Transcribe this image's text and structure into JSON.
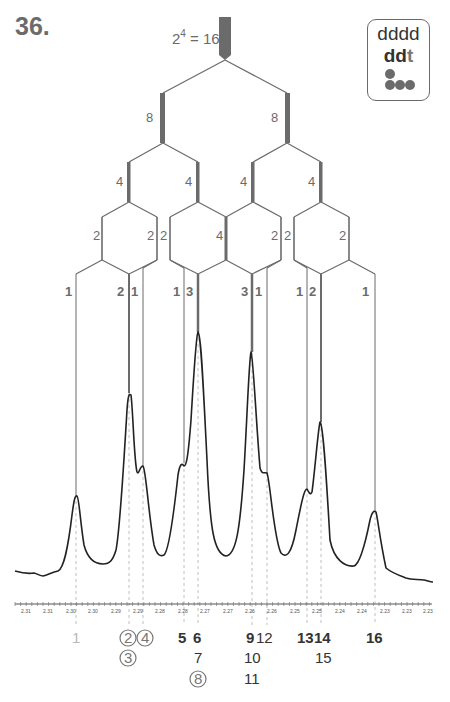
{
  "problem": {
    "number": "36."
  },
  "badge": {
    "line1": "dddd",
    "line2_bold": "dd",
    "line2_light": "t",
    "dots_icon": "1 dot over 3 dots"
  },
  "tree": {
    "top_label_base": "2",
    "top_label_exp": "4",
    "top_label_rest": " = 16",
    "level1_labels": [
      "8",
      "8"
    ],
    "level2_labels": [
      "4",
      "4",
      "4",
      "4"
    ],
    "level3_labels": [
      "2",
      "2",
      "2",
      "4",
      "2",
      "2",
      "2"
    ],
    "level4_labels": [
      "1",
      "2",
      "1",
      "1",
      "3",
      "3",
      "1",
      "1",
      "2",
      "1"
    ]
  },
  "colors": {
    "line": "#6b6b6b",
    "thick": "#6b6b6b",
    "spectrum": "#222222",
    "dash": "#b0b0b0",
    "label_gray": "#6b6b6b",
    "peak_label_dark": "#333333",
    "peak_label_light": "#b8b8b8"
  },
  "axis": {
    "tick_labels": [
      "2.31",
      "2.31",
      "2.30",
      "2.30",
      "2.29",
      "2.29",
      "2.28",
      "2.28",
      "2.27",
      "2.27",
      "2.26",
      "2.26",
      "2.25",
      "2.25",
      "2.24",
      "2.24",
      "2.23",
      "2.23",
      "2.23"
    ]
  },
  "peak_numbers": {
    "row1": [
      {
        "text": "1",
        "style": "light"
      },
      {
        "text": "2",
        "style": "circled"
      },
      {
        "text": "4",
        "style": "circled"
      },
      {
        "text": "5",
        "style": "bold"
      },
      {
        "text": "6",
        "style": "bold"
      },
      {
        "text": "9",
        "style": "bold"
      },
      {
        "text": "12",
        "style": "regular"
      },
      {
        "text": "13",
        "style": "bold"
      },
      {
        "text": "14",
        "style": "bold"
      },
      {
        "text": "16",
        "style": "bold"
      }
    ],
    "row2": [
      {
        "text": "3",
        "style": "circled"
      },
      {
        "text": "7",
        "style": "regular"
      },
      {
        "text": "10",
        "style": "regular"
      },
      {
        "text": "15",
        "style": "regular"
      }
    ],
    "row3": [
      {
        "text": "8",
        "style": "circled"
      },
      {
        "text": "11",
        "style": "regular"
      }
    ]
  }
}
